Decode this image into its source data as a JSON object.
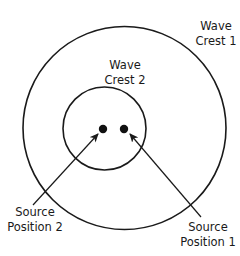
{
  "diagram": {
    "stroke_color": "#1a1a1a",
    "background": "#ffffff",
    "circles": [
      {
        "id": "wave-crest-1",
        "cx": 124.5,
        "cy": 128,
        "r": 101.5
      },
      {
        "id": "wave-crest-2",
        "cx": 104.5,
        "cy": 128.5,
        "r": 41.5
      }
    ],
    "sources": [
      {
        "id": "source-position-2",
        "cx": 103,
        "cy": 129,
        "r": 4.2
      },
      {
        "id": "source-position-1",
        "cx": 124,
        "cy": 129,
        "r": 4.2
      }
    ],
    "arrows": [
      {
        "id": "arrow-to-source-2",
        "x1": 33,
        "y1": 205,
        "x2": 98,
        "y2": 134
      },
      {
        "id": "arrow-to-source-1",
        "x1": 201,
        "y1": 217,
        "x2": 130,
        "y2": 134
      }
    ],
    "labels": {
      "crest1": {
        "line1": "Wave",
        "line2": "Crest 1"
      },
      "crest2": {
        "line1": "Wave",
        "line2": "Crest 2"
      },
      "source2": {
        "line1": "Source",
        "line2": "Position 2"
      },
      "source1": {
        "line1": "Source",
        "line2": "Position 1"
      }
    }
  }
}
